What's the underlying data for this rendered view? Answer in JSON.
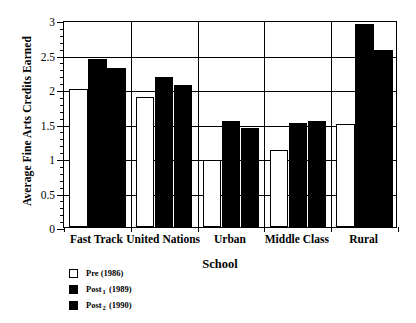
{
  "chart_data": {
    "type": "bar",
    "title": "",
    "xlabel": "School",
    "ylabel": "Average Fine Arts Credits Earned",
    "ylim": [
      0,
      3
    ],
    "yticks": [
      "0",
      "0.5",
      "1",
      "1.5",
      "2",
      "2.5",
      "3"
    ],
    "ytick_values": [
      0,
      0.5,
      1,
      1.5,
      2,
      2.5,
      3
    ],
    "minor_tick_step": 0.1,
    "grid": true,
    "legend_position": "below-left",
    "categories": [
      "Fast Track",
      "United Nations",
      "Urban",
      "Middle Class",
      "Rural"
    ],
    "series": [
      {
        "name": "Pre (1986)",
        "style": "hollow",
        "color": "#ffffff",
        "edge_color": "#000000",
        "values": [
          2.0,
          1.89,
          0.97,
          1.11,
          1.5
        ]
      },
      {
        "name": "Post1 (1989)",
        "label_base": "Post",
        "label_subscript": "1",
        "label_suffix": " (1989)",
        "style": "filled",
        "color": "#000000",
        "values": [
          2.43,
          2.17,
          1.54,
          1.51,
          2.94
        ]
      },
      {
        "name": "Post2 (1990)",
        "label_base": "Post",
        "label_subscript": "2",
        "label_suffix": " (1990)",
        "style": "filled",
        "color": "#000000",
        "values": [
          2.31,
          2.06,
          1.43,
          1.54,
          2.57
        ]
      }
    ]
  },
  "legend": {
    "items": [
      {
        "swatch": "hollow",
        "base": "Pre",
        "sub": "",
        "suffix": " (1986)"
      },
      {
        "swatch": "filled",
        "base": "Post",
        "sub": "1",
        "suffix": " (1989)"
      },
      {
        "swatch": "filled",
        "base": "Post",
        "sub": "2",
        "suffix": " (1990)"
      }
    ]
  }
}
